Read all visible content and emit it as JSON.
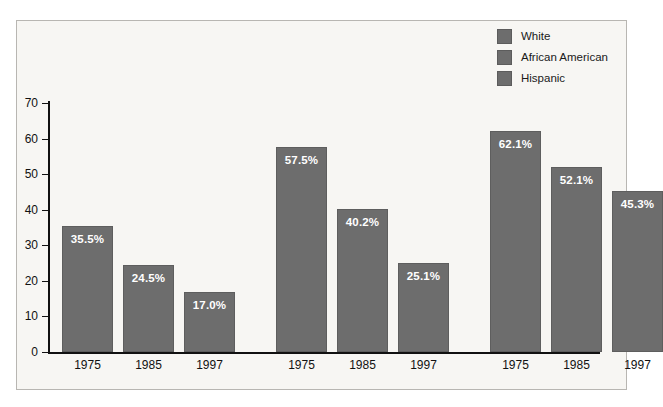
{
  "chart_data": {
    "type": "bar",
    "title": "",
    "xlabel": "",
    "ylabel": "",
    "ylim": [
      0,
      70
    ],
    "ytick_labels": [
      "70",
      "60",
      "50",
      "40",
      "30",
      "20",
      "10",
      "0"
    ],
    "yticks": [
      70,
      60,
      50,
      40,
      30,
      20,
      10,
      0
    ],
    "grid": false,
    "legend_position": "top-right",
    "categories": [
      "1975",
      "1985",
      "1997"
    ],
    "groups": [
      {
        "name": "White",
        "bars": [
          {
            "category": "1975",
            "value": 35.5,
            "label": "35.5%"
          },
          {
            "category": "1985",
            "value": 24.5,
            "label": "24.5%"
          },
          {
            "category": "1997",
            "value": 17.0,
            "label": "17.0%"
          }
        ]
      },
      {
        "name": "African American",
        "bars": [
          {
            "category": "1975",
            "value": 57.5,
            "label": "57.5%"
          },
          {
            "category": "1985",
            "value": 40.2,
            "label": "40.2%"
          },
          {
            "category": "1997",
            "value": 25.1,
            "label": "25.1%"
          }
        ]
      },
      {
        "name": "Hispanic",
        "bars": [
          {
            "category": "1975",
            "value": 62.1,
            "label": "62.1%"
          },
          {
            "category": "1985",
            "value": 52.1,
            "label": "52.1%"
          },
          {
            "category": "1997",
            "value": 45.3,
            "label": "45.3%"
          }
        ]
      }
    ],
    "series": [
      {
        "name": "White",
        "values": [
          35.5,
          24.5,
          17.0
        ]
      },
      {
        "name": "African American",
        "values": [
          57.5,
          40.2,
          25.1
        ]
      },
      {
        "name": "Hispanic",
        "values": [
          62.1,
          52.1,
          45.3
        ]
      }
    ],
    "x_tick_labels": [
      "1975",
      "1985",
      "1997",
      "1975",
      "1985",
      "1997",
      "1975",
      "1985",
      "1997"
    ],
    "bar_color": "#6d6d6d",
    "value_label_color": "#ffffff",
    "background_color": "#f7f6f3",
    "axis_color": "#111111"
  },
  "legend": {
    "items": [
      {
        "label": "White",
        "color": "#6d6d6d"
      },
      {
        "label": "African American",
        "color": "#6d6d6d"
      },
      {
        "label": "Hispanic",
        "color": "#6d6d6d"
      }
    ]
  }
}
